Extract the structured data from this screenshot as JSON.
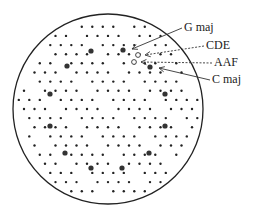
{
  "diagram": {
    "circle": {
      "cx": 108,
      "cy": 109,
      "r": 95
    },
    "big_dots": [
      [
        91,
        51
      ],
      [
        123,
        50
      ],
      [
        67,
        66
      ],
      [
        150,
        67
      ],
      [
        50,
        94
      ],
      [
        165,
        94
      ],
      [
        50,
        126
      ],
      [
        165,
        126
      ],
      [
        65,
        153
      ],
      [
        149,
        153
      ],
      [
        91,
        168
      ],
      [
        122,
        168
      ]
    ],
    "open_markers": [
      {
        "name": "CDE",
        "x": 138,
        "y": 55
      },
      {
        "name": "AAF",
        "x": 134,
        "y": 62
      }
    ],
    "labels": [
      {
        "key": "g_maj",
        "text": "G maj",
        "x": 184,
        "y": 20,
        "tx": 128,
        "ty": 49,
        "dashed": false
      },
      {
        "key": "cde",
        "text": "CDE",
        "x": 206,
        "y": 38,
        "tx": 141,
        "ty": 55,
        "dashed": true
      },
      {
        "key": "aaf",
        "text": "AAF",
        "x": 214,
        "y": 55,
        "tx": 137,
        "ty": 62,
        "dashed": true
      },
      {
        "key": "c_maj",
        "text": "C maj",
        "x": 212,
        "y": 72,
        "tx": 155,
        "ty": 68,
        "dashed": false
      }
    ],
    "colors": {
      "dot": "#222222",
      "line": "#333333"
    }
  }
}
